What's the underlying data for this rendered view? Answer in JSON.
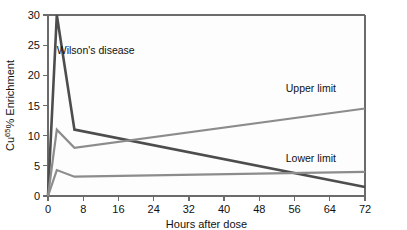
{
  "chart_data": {
    "type": "line",
    "title": "",
    "xlabel": "Hours after dose",
    "ylabel": "Cu65% Enrichment",
    "ylabel_base": "Cu",
    "ylabel_sup": "65",
    "ylabel_tail": "% Enrichment",
    "xlim": [
      0,
      72
    ],
    "ylim": [
      0,
      30
    ],
    "xticks": [
      0,
      8,
      16,
      24,
      32,
      40,
      48,
      56,
      64,
      72
    ],
    "yticks": [
      0,
      5,
      10,
      15,
      20,
      25,
      30
    ],
    "grid": false,
    "legend_position": "inline-annotations",
    "series": [
      {
        "name": "Wilson's disease",
        "color": "#4d4d4d",
        "label_x": 2,
        "label_y": 23.5,
        "x": [
          0,
          2,
          6,
          72
        ],
        "values": [
          0,
          30,
          11,
          1.5
        ]
      },
      {
        "name": "Upper limit",
        "color": "#8c8c8c",
        "label_x": 54,
        "label_y": 17.2,
        "x": [
          0,
          2,
          6,
          72
        ],
        "values": [
          0,
          11,
          8,
          14.5
        ]
      },
      {
        "name": "Lower limit",
        "color": "#8c8c8c",
        "label_x": 54,
        "label_y": 5.6,
        "x": [
          0,
          2,
          6,
          72
        ],
        "values": [
          0,
          4.3,
          3.2,
          4.0
        ]
      }
    ],
    "annotations": [
      {
        "text": "Wilson's disease"
      },
      {
        "text": "Upper limit"
      },
      {
        "text": "Lower limit"
      }
    ],
    "axis_color": "#6b6b6b",
    "plot_background": "#fdfdfd",
    "figure_background": "#ffffff"
  }
}
